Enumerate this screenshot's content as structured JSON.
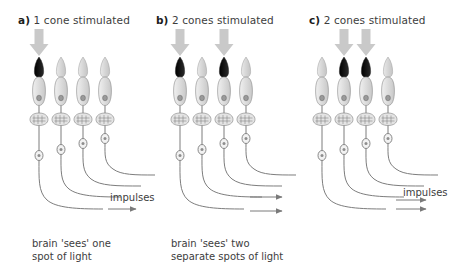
{
  "figure": {
    "type": "biology-diagram",
    "background_color": "#ffffff",
    "ink_color": "#6e6e6e",
    "text_color": "#3d3d3d",
    "stimulated_cone_color": "#1a1a1a",
    "unstimulated_cone_color": "#d2d2d2",
    "light_arrow_color": "#c9c9c9"
  },
  "panels": [
    {
      "id": "a",
      "label": "a)",
      "title": "1 cone stimulated",
      "cone_count": 4,
      "stimulated_cones": [
        1
      ],
      "light_arrows": [
        1
      ],
      "impulses_label": "impulses",
      "impulse_arrow_count": 1,
      "caption": "brain 'sees' one\nspot of light"
    },
    {
      "id": "b",
      "label": "b)",
      "title": "2 cones stimulated",
      "cone_count": 4,
      "stimulated_cones": [
        1,
        3
      ],
      "light_arrows": [
        1,
        3
      ],
      "impulses_label": "impulses",
      "impulse_arrow_count": 2,
      "caption": "brain 'sees' two\nseparate spots of light"
    },
    {
      "id": "c",
      "label": "c)",
      "title": "2 cones stimulated",
      "cone_count": 4,
      "stimulated_cones": [
        2,
        3
      ],
      "light_arrows": [
        2,
        3
      ],
      "impulses_label": "impulses",
      "impulse_arrow_count": 2,
      "caption": ""
    }
  ]
}
